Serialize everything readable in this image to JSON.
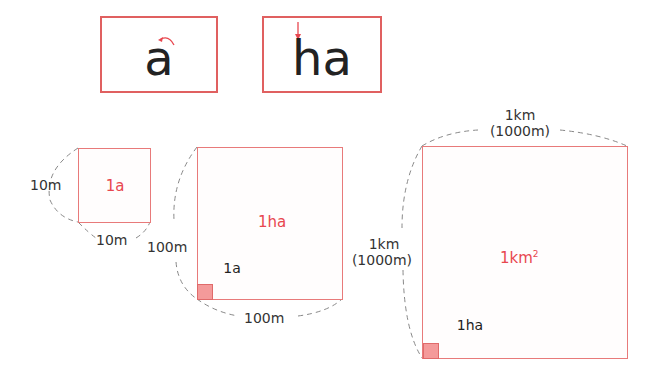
{
  "cards": [
    {
      "text": "a",
      "arrow": "counterclockwise-arc-arrow"
    },
    {
      "text": "ha",
      "arrow": "downward-stroke-arrow"
    }
  ],
  "squares": {
    "are": {
      "area": "1a",
      "side_left": "10m",
      "side_bottom": "10m"
    },
    "hectare": {
      "area": "1ha",
      "side_left": "100m",
      "side_bottom": "100m",
      "inner_unit": "1a"
    },
    "km2": {
      "area_base": "1km",
      "area_exp": "2",
      "side_left_1": "1km",
      "side_left_2": "(1000m)",
      "side_top_1": "1km",
      "side_top_2": "(1000m)",
      "inner_unit": "1ha"
    }
  },
  "colors": {
    "accent": "#e8474f",
    "border": "#e87a7a",
    "fill": "#f49a9a",
    "text": "#222222",
    "dash": "#888888"
  }
}
